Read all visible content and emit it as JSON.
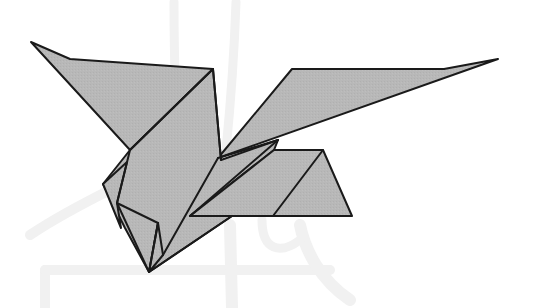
{
  "figure": {
    "background_color": "#ffffff",
    "paper_fill": "#b7b7b7",
    "line_color": "#1a1a1a",
    "ghost_color": "#f1f1f1"
  }
}
